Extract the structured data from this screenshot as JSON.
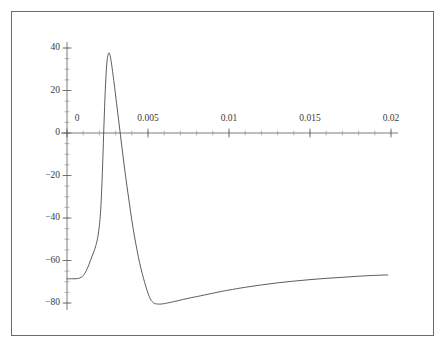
{
  "figure": {
    "frame_color": "#6b6b6b",
    "background": "#ffffff",
    "curve_color": "#4a4a4a",
    "axis_color": "#5a5a5a"
  },
  "chart_data": {
    "type": "line",
    "title": "",
    "subtitle": "",
    "xlabel": "",
    "ylabel": "",
    "xlim": [
      -0.0008,
      0.0208
    ],
    "ylim": [
      -86,
      42
    ],
    "grid": false,
    "legend": null,
    "x_ticks_major": [
      0,
      0.005,
      0.01,
      0.015,
      0.02
    ],
    "x_tick_labels": [
      "0",
      "0.005",
      "0.01",
      "0.015",
      "0.02"
    ],
    "x_ticks_minor_step": 0.001,
    "y_ticks_major": [
      40,
      20,
      0,
      -20,
      -40,
      -60,
      -80
    ],
    "y_tick_labels": [
      "40",
      "20",
      "0",
      "-20",
      "-40",
      "-60",
      "-80"
    ],
    "y_ticks_minor_step": 5,
    "axes_cross_at": [
      0,
      0
    ],
    "series": [
      {
        "name": "membrane potential",
        "x": [
          0.0,
          0.0002,
          0.00035,
          0.0005,
          0.00065,
          0.0008,
          0.00095,
          0.00105,
          0.00115,
          0.00125,
          0.00135,
          0.00145,
          0.00155,
          0.00165,
          0.00172,
          0.00178,
          0.00184,
          0.0019,
          0.00196,
          0.00202,
          0.00208,
          0.00214,
          0.0022,
          0.00226,
          0.00232,
          0.00238,
          0.00244,
          0.0025,
          0.00258,
          0.00266,
          0.00274,
          0.00284,
          0.00294,
          0.00306,
          0.00318,
          0.0033,
          0.00342,
          0.00356,
          0.0037,
          0.00384,
          0.004,
          0.00416,
          0.00432,
          0.00448,
          0.00464,
          0.0048,
          0.00494,
          0.00508,
          0.0052,
          0.0053,
          0.0054,
          0.0055,
          0.00565,
          0.0058,
          0.006,
          0.0062,
          0.0065,
          0.0068,
          0.0072,
          0.0076,
          0.008,
          0.0085,
          0.009,
          0.0095,
          0.01,
          0.011,
          0.012,
          0.013,
          0.014,
          0.015,
          0.016,
          0.017,
          0.018,
          0.019,
          0.0198
        ],
        "y": [
          -68.6,
          -68.6,
          -68.6,
          -68.6,
          -68.5,
          -68.2,
          -67.5,
          -66.6,
          -65.4,
          -63.8,
          -62.0,
          -60.0,
          -58.0,
          -56.0,
          -54.5,
          -53.0,
          -51.2,
          -49.0,
          -46.0,
          -42.0,
          -36.0,
          -27.0,
          -15.0,
          -1.0,
          12.0,
          23.0,
          31.0,
          35.5,
          37.7,
          36.5,
          33.0,
          27.5,
          21.5,
          14.0,
          6.5,
          -1.0,
          -8.5,
          -17.0,
          -25.0,
          -32.5,
          -41.0,
          -48.5,
          -55.0,
          -61.0,
          -66.0,
          -70.5,
          -74.0,
          -77.0,
          -78.8,
          -79.7,
          -80.2,
          -80.4,
          -80.5,
          -80.5,
          -80.3,
          -80.0,
          -79.5,
          -79.0,
          -78.3,
          -77.6,
          -77.0,
          -76.2,
          -75.4,
          -74.6,
          -73.9,
          -72.6,
          -71.5,
          -70.5,
          -69.7,
          -69.0,
          -68.4,
          -67.9,
          -67.4,
          -67.0,
          -66.8
        ],
        "resting_potential": -68.6,
        "peak_value": 37.7,
        "peak_x": 0.00258,
        "trough_value": -80.5,
        "trough_x": 0.0055,
        "end_value": -66.8
      }
    ]
  },
  "axis_ticks": {
    "x_major": [
      {
        "value": 0,
        "label": "0",
        "px": 67
      },
      {
        "value": 0.005,
        "label": "0.005",
        "px": 148
      },
      {
        "value": 0.01,
        "label": "0.01",
        "px": 229
      },
      {
        "value": 0.015,
        "label": "0.015",
        "px": 310
      },
      {
        "value": 0.02,
        "label": "0.02",
        "px": 391
      }
    ],
    "y_major": [
      {
        "value": 40,
        "label": "40",
        "px": 48
      },
      {
        "value": 20,
        "label": "20",
        "px": 90.5
      },
      {
        "value": 0,
        "label": "0",
        "px": 133
      },
      {
        "value": -20,
        "label": "-20",
        "px": 175.5
      },
      {
        "value": -40,
        "label": "-40",
        "px": 218
      },
      {
        "value": -60,
        "label": "-60",
        "px": 260.5
      },
      {
        "value": -80,
        "label": "-80",
        "px": 303
      }
    ]
  }
}
